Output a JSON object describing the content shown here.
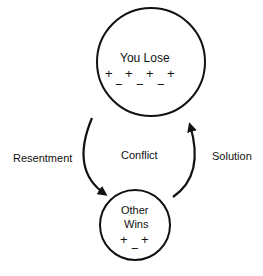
{
  "diagram": {
    "top_node": {
      "label": "You Lose",
      "plus_row": [
        "+",
        "+",
        "+",
        "+"
      ],
      "minus_row": [
        "−",
        "−",
        "−"
      ]
    },
    "bottom_node": {
      "label_line1": "Other",
      "label_line2": "Wins",
      "plus_row": [
        "+",
        "+"
      ],
      "minus_row": [
        "−"
      ]
    },
    "left_arrow_label": "Resentment",
    "center_label": "Conflict",
    "right_arrow_label": "Solution",
    "stroke_color": "#111111"
  }
}
